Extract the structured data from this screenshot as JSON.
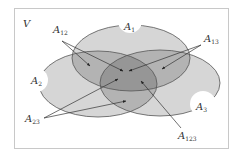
{
  "diagram": {
    "type": "venn",
    "universe_label": "V",
    "sets": [
      {
        "name": "A",
        "sub": "1"
      },
      {
        "name": "A",
        "sub": "2"
      },
      {
        "name": "A",
        "sub": "3"
      }
    ],
    "intersections": [
      {
        "name": "A",
        "sub": "12"
      },
      {
        "name": "A",
        "sub": "13"
      },
      {
        "name": "A",
        "sub": "23"
      },
      {
        "name": "A",
        "sub": "123"
      }
    ],
    "colors": {
      "frame": "#c8c8c8",
      "outline": "#555555",
      "fill_layer": "#000000",
      "notch": "#ffffff",
      "arrow": "#333333"
    }
  }
}
